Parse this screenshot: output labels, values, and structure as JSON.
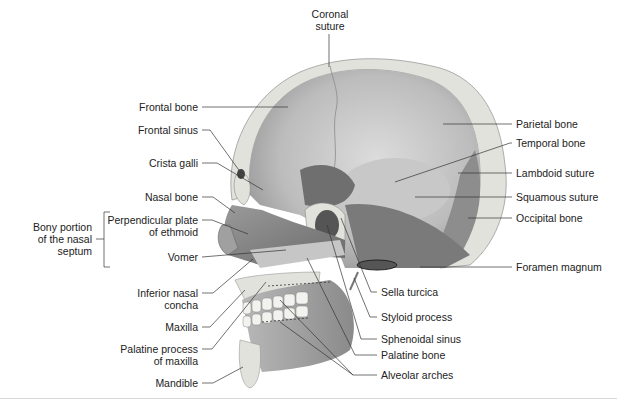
{
  "figure": {
    "labels_left": [
      {
        "id": "frontal-bone",
        "text": "Frontal bone"
      },
      {
        "id": "frontal-sinus",
        "text": "Frontal sinus"
      },
      {
        "id": "crista-galli",
        "text": "Crista galli"
      },
      {
        "id": "nasal-bone",
        "text": "Nasal bone"
      },
      {
        "id": "perpendicular-plate",
        "line1": "Perpendicular plate",
        "line2": "of ethmoid"
      },
      {
        "id": "vomer",
        "text": "Vomer"
      },
      {
        "id": "inferior-nasal-concha",
        "line1": "Inferior nasal",
        "line2": "concha"
      },
      {
        "id": "maxilla",
        "text": "Maxilla"
      },
      {
        "id": "palatine-process",
        "line1": "Palatine process",
        "line2": "of maxilla"
      },
      {
        "id": "mandible",
        "text": "Mandible"
      }
    ],
    "group_label": {
      "line1": "Bony portion",
      "line2": "of the nasal",
      "line3": "septum"
    },
    "label_top": {
      "line1": "Coronal",
      "line2": "suture"
    },
    "labels_right": [
      {
        "id": "parietal-bone",
        "text": "Parietal bone"
      },
      {
        "id": "temporal-bone",
        "text": "Temporal bone"
      },
      {
        "id": "lambdoid-suture",
        "text": "Lambdoid suture"
      },
      {
        "id": "squamous-suture",
        "text": "Squamous suture"
      },
      {
        "id": "occipital-bone",
        "text": "Occipital bone"
      },
      {
        "id": "foramen-magnum",
        "text": "Foramen magnum"
      }
    ],
    "labels_bottom": [
      {
        "id": "sella-turcica",
        "text": "Sella turcica"
      },
      {
        "id": "styloid-process",
        "text": "Styloid process"
      },
      {
        "id": "sphenoidal-sinus",
        "text": "Sphenoidal sinus"
      },
      {
        "id": "palatine-bone",
        "text": "Palatine bone"
      },
      {
        "id": "alveolar-arches",
        "text": "Alveolar arches"
      }
    ],
    "colors": {
      "bone_cut": "#e2e2dc",
      "inner_light": "#d0d0d0",
      "inner_mid": "#a9a9a9",
      "inner_dark": "#6e6e6e",
      "leader": "#333333"
    }
  }
}
